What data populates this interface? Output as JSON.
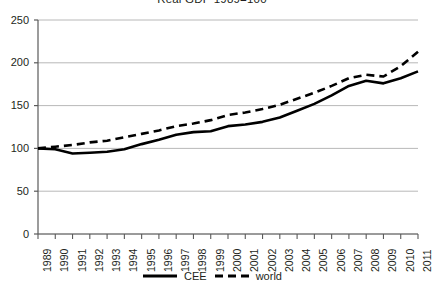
{
  "chart_data": {
    "type": "line",
    "title": "Real GDP 1989=100",
    "xlabel": "",
    "ylabel": "",
    "x": [
      1989,
      1990,
      1991,
      1992,
      1993,
      1994,
      1995,
      1996,
      1997,
      1998,
      1999,
      2000,
      2001,
      2002,
      2003,
      2004,
      2005,
      2006,
      2007,
      2008,
      2009,
      2010,
      2011
    ],
    "categories": [
      "1989",
      "1990",
      "1991",
      "1992",
      "1993",
      "1994",
      "1995",
      "1996",
      "1997",
      "1998",
      "1999",
      "2000",
      "2001",
      "2002",
      "2003",
      "2004",
      "2005",
      "2006",
      "2007",
      "2008",
      "2009",
      "2010",
      "2011"
    ],
    "series": [
      {
        "name": "CEE",
        "style": "solid",
        "color": "#000000",
        "values": [
          100,
          99,
          94,
          95,
          96,
          99,
          105,
          110,
          116,
          119,
          120,
          126,
          128,
          131,
          136,
          144,
          152,
          162,
          173,
          179,
          176,
          182,
          190
        ]
      },
      {
        "name": "world",
        "style": "dashed",
        "color": "#000000",
        "values": [
          100,
          102,
          104,
          107,
          109,
          113,
          117,
          121,
          126,
          129,
          133,
          139,
          142,
          146,
          151,
          158,
          165,
          173,
          182,
          186,
          184,
          196,
          213
        ]
      }
    ],
    "ylim": [
      0,
      250
    ],
    "y_ticks": [
      0,
      50,
      100,
      150,
      200,
      250
    ],
    "grid": true,
    "legend_position": "bottom",
    "legend_entries": [
      "CEE",
      "world"
    ]
  },
  "axis": {
    "y_tick_labels": [
      "250",
      "200",
      "150",
      "100",
      "50",
      "0"
    ],
    "x_tick_labels": [
      "1989",
      "1990",
      "1991",
      "1992",
      "1993",
      "1994",
      "1995",
      "1996",
      "1997",
      "1998",
      "1999",
      "2000",
      "2001",
      "2002",
      "2003",
      "2004",
      "2005",
      "2006",
      "2007",
      "2008",
      "2009",
      "2010",
      "2011"
    ]
  },
  "legend": {
    "items": [
      {
        "label": "CEE",
        "style": "solid"
      },
      {
        "label": "world",
        "style": "dashed"
      }
    ]
  },
  "colors": {
    "line": "#000000",
    "grid": "#a6a6a6",
    "axis": "#5a5a5a",
    "text": "#231f20",
    "background": "#ffffff"
  }
}
